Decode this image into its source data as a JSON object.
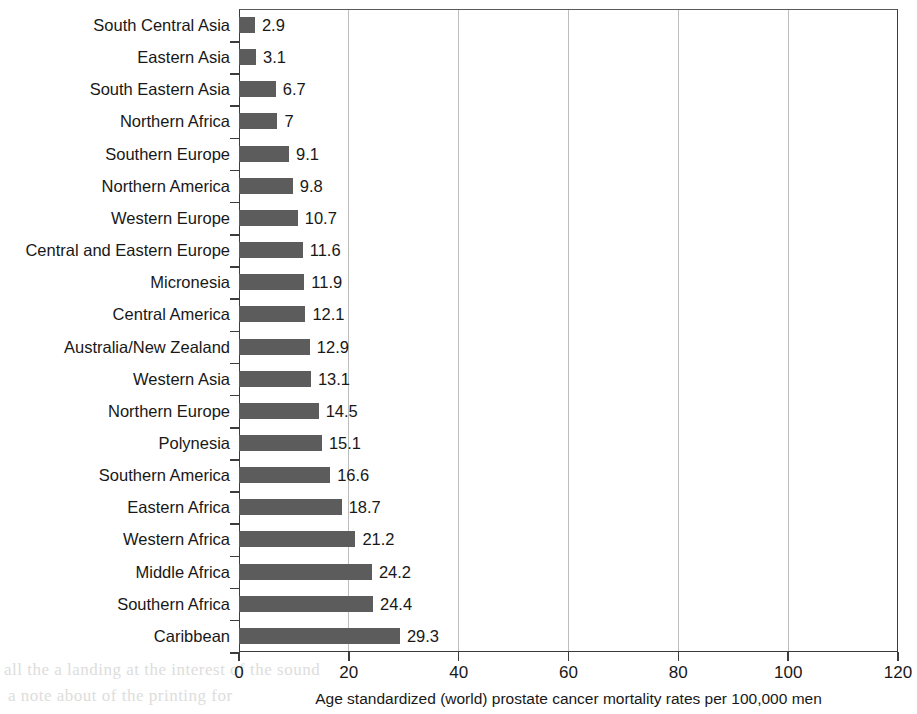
{
  "chart_data": {
    "type": "bar",
    "orientation": "horizontal",
    "title": "",
    "xlabel": "Age standardized (world) prostate cancer mortality rates per 100,000 men",
    "ylabel": "",
    "xlim": [
      0,
      120
    ],
    "xticks": [
      0,
      20,
      40,
      60,
      80,
      100,
      120
    ],
    "grid": "vertical",
    "legend": null,
    "bar_color": "#5c5c5c",
    "categories": [
      "South Central Asia",
      "Eastern Asia",
      "South Eastern Asia",
      "Northern Africa",
      "Southern Europe",
      "Northern America",
      "Western Europe",
      "Central and Eastern Europe",
      "Micronesia",
      "Central America",
      "Australia/New Zealand",
      "Western Asia",
      "Northern Europe",
      "Polynesia",
      "Southern America",
      "Eastern Africa",
      "Western Africa",
      "Middle Africa",
      "Southern Africa",
      "Caribbean"
    ],
    "values": [
      2.9,
      3.1,
      6.7,
      7,
      9.1,
      9.8,
      10.7,
      11.6,
      11.9,
      12.1,
      12.9,
      13.1,
      14.5,
      15.1,
      16.6,
      18.7,
      21.2,
      24.2,
      24.4,
      29.3
    ],
    "value_labels": [
      "2.9",
      "3.1",
      "6.7",
      "7",
      "9.1",
      "9.8",
      "10.7",
      "11.6",
      "11.9",
      "12.1",
      "12.9",
      "13.1",
      "14.5",
      "15.1",
      "16.6",
      "18.7",
      "21.2",
      "24.2",
      "24.4",
      "29.3"
    ]
  },
  "scan_artifacts": [
    {
      "text": "all the a landing at the interest of the sound",
      "left": 4,
      "top": 660
    },
    {
      "text": "a  note  about  of  the  printing  for",
      "left": 8,
      "top": 686
    }
  ]
}
